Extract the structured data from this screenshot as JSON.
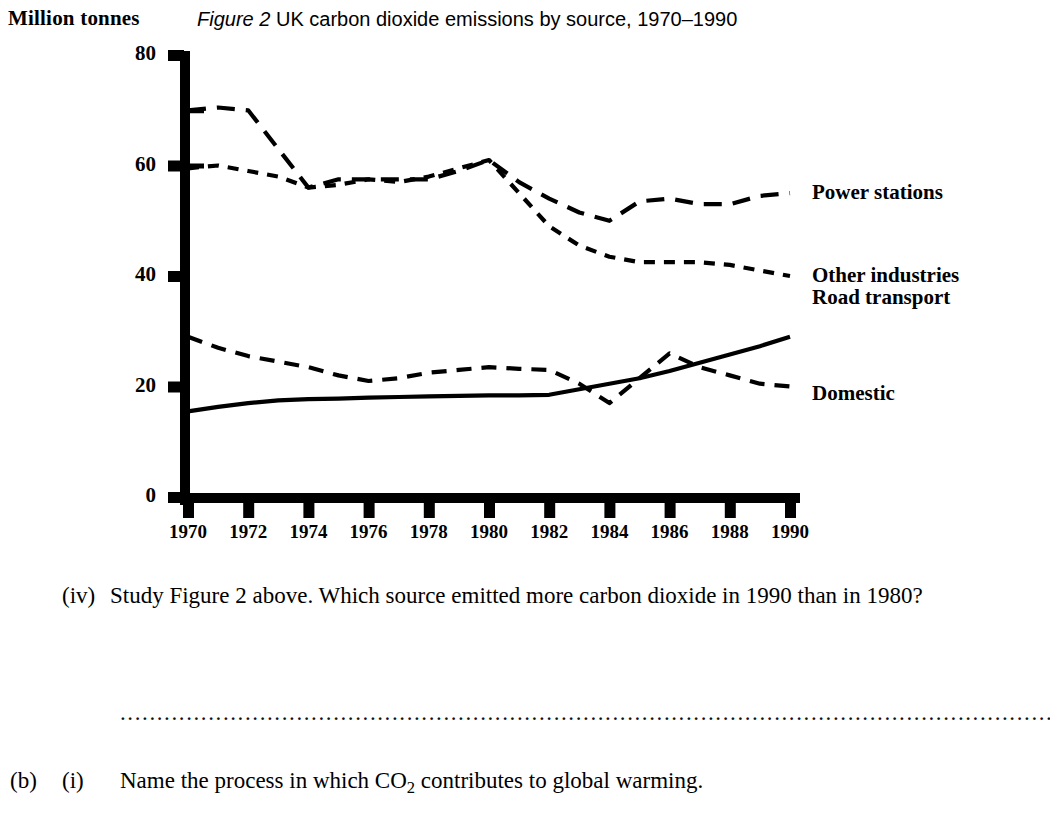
{
  "figure": {
    "unit_label": "Million tonnes",
    "title_prefix": "Figure 2",
    "title_rest": " UK carbon dioxide emissions by source, 1970–1990"
  },
  "chart_data": {
    "type": "line",
    "title": "Figure 2 UK carbon dioxide emissions by source, 1970–1990",
    "xlabel": "",
    "ylabel": "Million tonnes",
    "xlim": [
      1970,
      1990
    ],
    "ylim": [
      0,
      80
    ],
    "grid": false,
    "legend_position": "right-end-of-line",
    "yticks": [
      0,
      20,
      40,
      60,
      80
    ],
    "xticks": [
      1970,
      1972,
      1974,
      1976,
      1978,
      1980,
      1982,
      1984,
      1986,
      1988,
      1990
    ],
    "x": [
      1970,
      1971,
      1972,
      1973,
      1974,
      1975,
      1976,
      1977,
      1978,
      1979,
      1980,
      1981,
      1982,
      1983,
      1984,
      1985,
      1986,
      1987,
      1988,
      1989,
      1990
    ],
    "series": [
      {
        "name": "Power stations",
        "style": "long-dash",
        "values": [
          70.0,
          70.5,
          70.0,
          63.0,
          56.0,
          57.5,
          57.5,
          57.5,
          57.5,
          59.0,
          61.0,
          57.0,
          54.0,
          51.5,
          50.0,
          53.5,
          54.0,
          53.0,
          53.0,
          54.5,
          55.0
        ]
      },
      {
        "name": "Other industries",
        "style": "short-dash",
        "values": [
          59.5,
          60.0,
          59.0,
          58.0,
          56.0,
          56.5,
          57.5,
          57.0,
          58.0,
          59.5,
          61.0,
          55.0,
          49.0,
          45.5,
          43.5,
          42.5,
          42.5,
          42.5,
          42.0,
          41.0,
          40.0
        ]
      },
      {
        "name": "Road transport",
        "style": "solid",
        "values": [
          15.5,
          16.3,
          17.0,
          17.5,
          17.7,
          17.8,
          18.0,
          18.1,
          18.2,
          18.3,
          18.4,
          18.4,
          18.5,
          19.5,
          20.5,
          21.5,
          22.8,
          24.3,
          25.8,
          27.3,
          29.0
        ]
      },
      {
        "name": "Domestic",
        "style": "medium-dash",
        "values": [
          29.0,
          27.0,
          25.5,
          24.5,
          23.5,
          22.0,
          21.0,
          21.5,
          22.5,
          23.0,
          23.5,
          23.2,
          23.0,
          20.5,
          17.0,
          21.5,
          26.0,
          23.5,
          22.0,
          20.5,
          20.0
        ]
      }
    ]
  },
  "questions": {
    "q_iv": {
      "marker": "(iv)",
      "text": "Study Figure 2 above. Which source emitted more carbon dioxide in 1990 than in 1980?"
    },
    "answer_line_dots": "...............................................................................................................................................................................................................",
    "q_b_i": {
      "marker_b": "(b)",
      "marker_i": "(i)",
      "text_before": "Name the process in which CO",
      "subscript": "2",
      "text_after": " contributes to global warming."
    }
  }
}
